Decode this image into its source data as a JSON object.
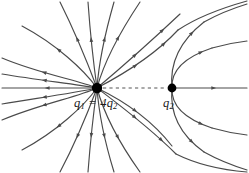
{
  "figure": {
    "kind": "electric-field-line-diagram",
    "width": 249,
    "height": 173,
    "background_color": "#ffffff",
    "line_color": "#4a4a4a",
    "charge_color": "#000000",
    "axis_dash_color": "#555555"
  },
  "labels": {
    "q1_full": "q1 = 4q2",
    "q1_left": "q",
    "q1_left_sub": "1",
    "q1_relation": " = 4",
    "q1_right": "q",
    "q1_right_sub": "2",
    "q2_main": "q",
    "q2_sub": "2"
  },
  "charges": [
    {
      "name": "q1",
      "label": "q1 = 4q2",
      "x": 97,
      "y": 88,
      "radius": 5.2,
      "magnitude": 4,
      "sign": "negative",
      "field_direction": "inward"
    },
    {
      "name": "q2",
      "label": "q2",
      "x": 172,
      "y": 88,
      "radius": 4.4,
      "magnitude": 1,
      "sign": "negative",
      "field_direction": "inward"
    }
  ],
  "axis_line": {
    "name": "charge-separation-axis",
    "style": "dashed",
    "x1": 103,
    "y1": 88,
    "x2": 167,
    "y2": 88
  },
  "field_lines": [
    {
      "id": "L01",
      "d": "M 97 88 C 78 80, 40 74, 2 58",
      "arrows": [
        0.55
      ]
    },
    {
      "id": "L02",
      "d": "M 97 88 C 74 84, 38 80, 2 74",
      "arrows": [
        0.55
      ]
    },
    {
      "id": "L03",
      "d": "M 97 88 L 2 88",
      "arrows": [
        0.52
      ]
    },
    {
      "id": "L04",
      "d": "M 97 88 C 74 93, 38 98, 2 104",
      "arrows": [
        0.55
      ]
    },
    {
      "id": "L05",
      "d": "M 97 88 C 78 97, 40 104, 2 120",
      "arrows": [
        0.55
      ]
    },
    {
      "id": "L06",
      "d": "M 97 88 C 84 70, 56 44, 22 26",
      "arrows": [
        0.55
      ]
    },
    {
      "id": "L07",
      "d": "M 97 88 C 88 64, 76 34, 60 2",
      "arrows": [
        0.56
      ]
    },
    {
      "id": "L08",
      "d": "M 97 88 C 93 60, 90 30, 88 2",
      "arrows": [
        0.56
      ]
    },
    {
      "id": "L09",
      "d": "M 97 88 C 99 60, 106 30, 114 2",
      "arrows": [
        0.56
      ]
    },
    {
      "id": "L10",
      "d": "M 97 88 C 104 62, 120 32, 140 2",
      "arrows": [
        0.56
      ]
    },
    {
      "id": "L11",
      "d": "M 97 88 C 84 106, 56 132, 22 150",
      "arrows": [
        0.55
      ]
    },
    {
      "id": "L12",
      "d": "M 97 88 C 88 112, 76 142, 60 172",
      "arrows": [
        0.56
      ]
    },
    {
      "id": "L13",
      "d": "M 97 88 C 93 116, 90 146, 88 172",
      "arrows": [
        0.56
      ]
    },
    {
      "id": "L14",
      "d": "M 97 88 C 99 116, 106 146, 114 172",
      "arrows": [
        0.56
      ]
    },
    {
      "id": "L15",
      "d": "M 97 88 C 104 114, 120 144, 140 172",
      "arrows": [
        0.56
      ]
    },
    {
      "id": "L16",
      "d": "M 97 88 C 116 72, 146 46, 180 14",
      "arrows": [
        0.45,
        0.78
      ]
    },
    {
      "id": "L17",
      "d": "M 97 88 C 120 76, 152 58, 178 30",
      "arrows": [
        0.44,
        0.8
      ]
    },
    {
      "id": "L18",
      "d": "M 97 88 C 118 104, 148 126, 176 154",
      "arrows": [
        0.46,
        0.8
      ]
    },
    {
      "id": "L19",
      "d": "M 97 88 C 122 100, 150 118, 172 146",
      "arrows": [
        0.46
      ]
    },
    {
      "id": "L20",
      "d": "M 172 88 C 170 68, 176 44, 204 22",
      "arrows": [
        0.78
      ]
    },
    {
      "id": "L21",
      "d": "M 172 88 C 171 72, 182 58, 212 48",
      "arrows": [
        0.8
      ]
    },
    {
      "id": "L22",
      "d": "M 172 88 L 247 88",
      "arrows": [
        0.55
      ]
    },
    {
      "id": "L23",
      "d": "M 172 88 C 171 104, 182 118, 212 128",
      "arrows": [
        0.8
      ]
    },
    {
      "id": "L24",
      "d": "M 172 88 C 170 108, 176 132, 204 152",
      "arrows": [
        0.78
      ]
    },
    {
      "id": "L25",
      "d": "M 204 22 C 222 12, 234 8, 247 4",
      "arrows": []
    },
    {
      "id": "L26",
      "d": "M 212 48 C 226 44, 238 42, 247 41",
      "arrows": []
    },
    {
      "id": "L27",
      "d": "M 212 128 C 226 132, 238 134, 247 135",
      "arrows": []
    },
    {
      "id": "L28",
      "d": "M 204 152 C 222 162, 234 166, 247 170",
      "arrows": []
    },
    {
      "id": "L29",
      "d": "M 178 30 C 196 18, 222 8, 247 1",
      "arrows": []
    },
    {
      "id": "L30",
      "d": "M 176 154 C 196 164, 222 170, 247 172",
      "arrows": []
    }
  ]
}
